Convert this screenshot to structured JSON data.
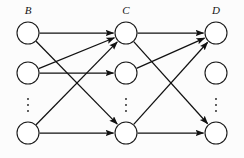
{
  "figure": {
    "type": "layered-directed-graph",
    "background_color": "#fcfcfc",
    "stroke_color": "#111111",
    "node_fill": "#ffffff",
    "width": 244,
    "height": 158
  },
  "layers": [
    {
      "id": "B",
      "label": "B",
      "label_x": 28,
      "label_y": 14,
      "column_x": 28,
      "nodes": [
        {
          "id": "B1",
          "cx": 28,
          "cy": 33,
          "r": 11
        },
        {
          "id": "B2",
          "cx": 28,
          "cy": 73,
          "r": 11
        },
        {
          "id": "B3",
          "cx": 28,
          "cy": 133,
          "r": 11
        }
      ],
      "ellipsis": {
        "x": 28,
        "y": 105
      }
    },
    {
      "id": "C",
      "label": "C",
      "label_x": 126,
      "label_y": 14,
      "column_x": 126,
      "nodes": [
        {
          "id": "C1",
          "cx": 126,
          "cy": 33,
          "r": 11
        },
        {
          "id": "C2",
          "cx": 126,
          "cy": 73,
          "r": 11
        },
        {
          "id": "C3",
          "cx": 126,
          "cy": 133,
          "r": 11
        }
      ],
      "ellipsis": {
        "x": 126,
        "y": 105
      }
    },
    {
      "id": "D",
      "label": "D",
      "label_x": 216,
      "label_y": 14,
      "column_x": 216,
      "nodes": [
        {
          "id": "D1",
          "cx": 216,
          "cy": 33,
          "r": 11
        },
        {
          "id": "D2",
          "cx": 216,
          "cy": 73,
          "r": 11
        },
        {
          "id": "D3",
          "cx": 216,
          "cy": 133,
          "r": 11
        }
      ],
      "ellipsis": {
        "x": 216,
        "y": 105
      }
    }
  ],
  "edges": [
    {
      "id": "e1",
      "from": "B1",
      "to": "C1",
      "arrow": true
    },
    {
      "id": "e2",
      "from": "B1",
      "to": "C3",
      "arrow": true
    },
    {
      "id": "e3",
      "from": "B2",
      "to": "C1",
      "arrow": true
    },
    {
      "id": "e4",
      "from": "B2",
      "to": "C2",
      "arrow": true
    },
    {
      "id": "e5",
      "from": "B3",
      "to": "C1",
      "arrow": true
    },
    {
      "id": "e6",
      "from": "B3",
      "to": "C3",
      "arrow": true
    },
    {
      "id": "e7",
      "from": "C1",
      "to": "D1",
      "arrow": true
    },
    {
      "id": "e8",
      "from": "C1",
      "to": "D3",
      "arrow": true
    },
    {
      "id": "e9",
      "from": "C2",
      "to": "D1",
      "arrow": true
    },
    {
      "id": "e10",
      "from": "C3",
      "to": "D1",
      "arrow": true
    },
    {
      "id": "e11",
      "from": "C3",
      "to": "D3",
      "arrow": true
    }
  ],
  "ellipsis_glyph": "⋮"
}
